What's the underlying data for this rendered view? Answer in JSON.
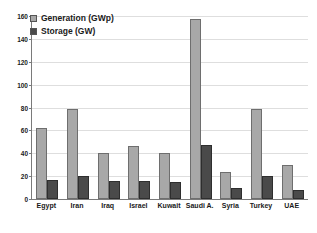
{
  "chart_data": {
    "type": "bar",
    "title": "",
    "xlabel": "",
    "ylabel": "",
    "ylim": [
      0,
      160
    ],
    "grid": true,
    "legend_position": "top-left",
    "categories": [
      "Egypt",
      "Iran",
      "Iraq",
      "Israel",
      "Kuwait",
      "Saudi A.",
      "Syria",
      "Turkey",
      "UAE"
    ],
    "ytick_labels": [
      "160",
      "140",
      "120",
      "100",
      "80",
      "60",
      "40",
      "20",
      "0"
    ],
    "ytick_values": [
      160,
      140,
      120,
      100,
      80,
      60,
      40,
      20,
      0
    ],
    "series": [
      {
        "name": "Generation (GWp)",
        "color": "#a8a8a8",
        "values": [
          62,
          79,
          40,
          46,
          40,
          157,
          24,
          79,
          30
        ]
      },
      {
        "name": "Storage (GW)",
        "color": "#4a4a4a",
        "values": [
          17,
          20,
          16,
          16,
          15,
          47,
          10,
          20,
          8
        ]
      }
    ]
  },
  "legend": {
    "items": [
      {
        "label": "Generation (GWp)",
        "color": "#a8a8a8"
      },
      {
        "label": "Storage (GW)",
        "color": "#4a4a4a"
      }
    ]
  }
}
